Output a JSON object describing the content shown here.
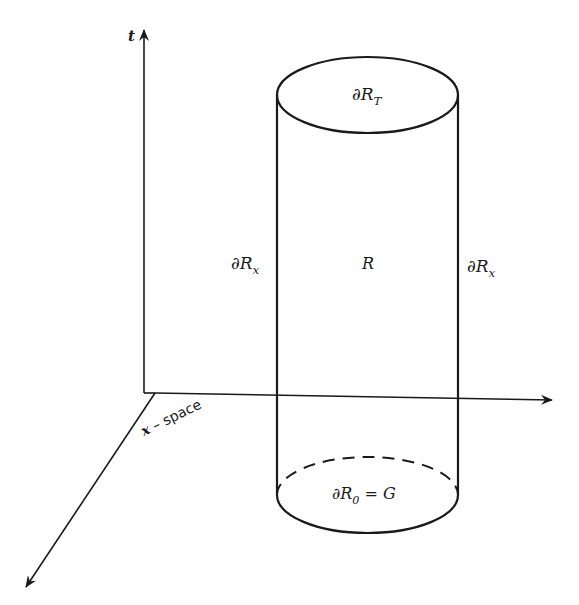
{
  "diagram": {
    "type": "space-time cylinder region",
    "axes": {
      "vertical": {
        "label": "t"
      },
      "horizontal": {
        "label": ""
      },
      "diagonal": {
        "label_var": "x",
        "label_rest": " – space"
      }
    },
    "cylinder": {
      "top_label": {
        "symbol": "∂R",
        "sub": "T"
      },
      "interior_label": "R",
      "left_side_label": {
        "symbol": "∂R",
        "sub": "x"
      },
      "right_side_label": {
        "symbol": "∂R",
        "sub": "x"
      },
      "bottom_label": {
        "symbol": "∂R",
        "sub": "0",
        "suffix": " = G"
      }
    },
    "colors": {
      "stroke": "#1a1a1a",
      "background": "#ffffff"
    }
  }
}
